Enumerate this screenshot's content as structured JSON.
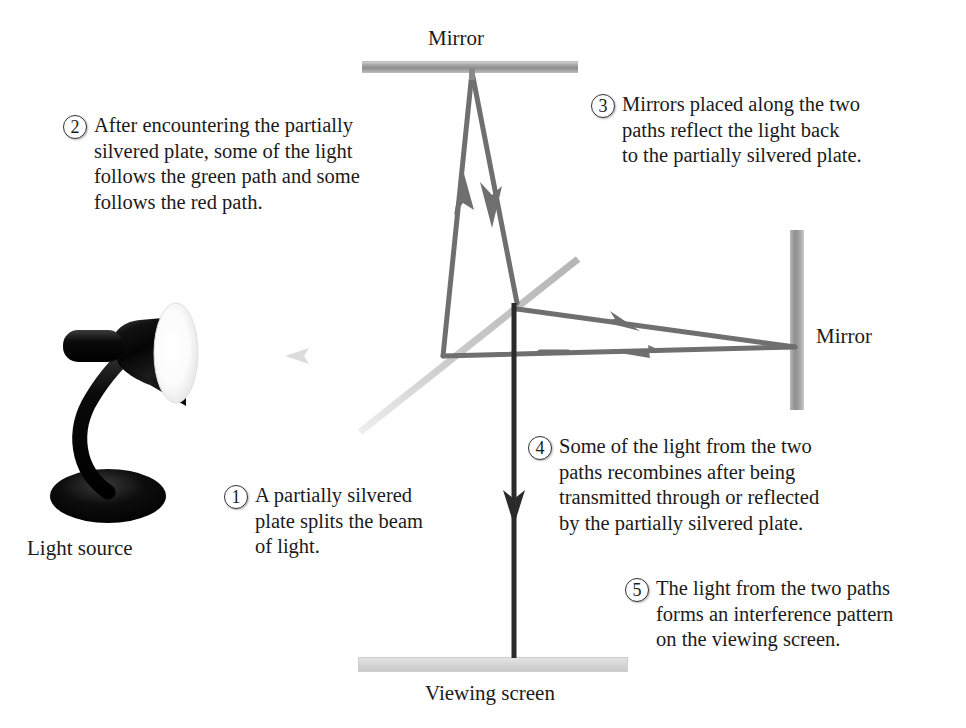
{
  "figure": {
    "background": "#ffffff"
  },
  "labels": {
    "mirror_top": "Mirror",
    "mirror_right": "Mirror",
    "light_source": "Light source",
    "viewing_screen": "Viewing screen"
  },
  "callouts": [
    {
      "number": "1",
      "text": "A partially silvered\nplate splits the beam\nof light."
    },
    {
      "number": "2",
      "text": "After encountering the partially\nsilvered plate, some of the light\nfollows the green path and some\nfollows the red path."
    },
    {
      "number": "3",
      "text": "Mirrors placed along the two\npaths reflect the light back\nto the partially silvered plate."
    },
    {
      "number": "4",
      "text": "Some of the light from the two\npaths recombines after being\ntransmitted through or reflected\nby the partially silvered plate."
    },
    {
      "number": "5",
      "text": "The light from the two paths\nforms an interference pattern\non the viewing screen."
    }
  ],
  "colors": {
    "beam_incident": "#d8d8d8",
    "beam_path": "#6e6e6e",
    "beam_output": "#2b2b2b",
    "beam_splitter": "#c6c6c6",
    "mirror_face": "#9a9a9a",
    "screen_face": "#d6d6d6",
    "lamp_body": "#0d0d0d",
    "text": "#1b1b1b"
  },
  "optics": {
    "beam_splitter_label": "partially silvered plate",
    "components": [
      "light-source-lamp",
      "beam-splitter-plate",
      "top-mirror",
      "right-mirror",
      "viewing-screen"
    ],
    "beam_segments": [
      {
        "name": "incident-beam",
        "from": "light source",
        "to": "beam splitter",
        "direction": "right"
      },
      {
        "name": "vertical-up-beam",
        "from": "beam splitter",
        "to": "top mirror",
        "direction": "up"
      },
      {
        "name": "vertical-down-beam",
        "from": "top mirror",
        "to": "beam splitter",
        "direction": "down"
      },
      {
        "name": "horizontal-out-beam",
        "from": "beam splitter",
        "to": "right mirror",
        "direction": "right"
      },
      {
        "name": "horizontal-return-beam",
        "from": "right mirror",
        "to": "beam splitter",
        "direction": "left"
      },
      {
        "name": "recombined-beam",
        "from": "beam splitter",
        "to": "viewing screen",
        "direction": "down"
      }
    ]
  }
}
